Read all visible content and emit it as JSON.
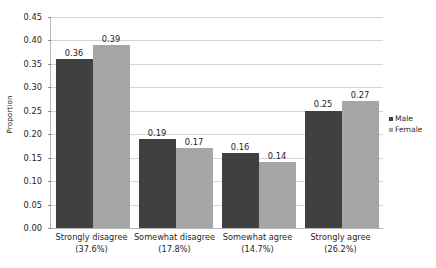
{
  "chart_data": {
    "type": "bar",
    "title": "",
    "xlabel": "",
    "ylabel": "Proportion",
    "ylim": [
      0.0,
      0.45
    ],
    "ytick_step": 0.05,
    "grid": true,
    "legend_position": "right",
    "categories": [
      "Strongly disagree",
      "Somewhat disagree",
      "Somewhat agree",
      "Strongly agree"
    ],
    "category_percentages": [
      "(37.6%)",
      "(17.8%)",
      "(14.7%)",
      "(26.2%)"
    ],
    "ytick_labels": [
      "0.45",
      "0.40",
      "0.35",
      "0.30",
      "0.25",
      "0.20",
      "0.15",
      "0.10",
      "0.05",
      "0.00"
    ],
    "ytick_values": [
      0.45,
      0.4,
      0.35,
      0.3,
      0.25,
      0.2,
      0.15,
      0.1,
      0.05,
      0.0
    ],
    "series": [
      {
        "name": "Male",
        "color": "#404040",
        "values": [
          0.36,
          0.19,
          0.16,
          0.25
        ],
        "labels": [
          "0.36",
          "0.19",
          "0.16",
          "0.25"
        ]
      },
      {
        "name": "Female",
        "color": "#a6a6a6",
        "values": [
          0.39,
          0.17,
          0.14,
          0.27
        ],
        "labels": [
          "0.39",
          "0.17",
          "0.14",
          "0.27"
        ]
      }
    ]
  }
}
